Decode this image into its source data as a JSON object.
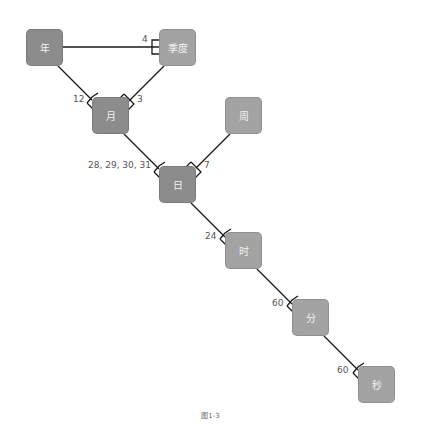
{
  "diagram": {
    "nodes": [
      {
        "id": "year",
        "label": "年",
        "shade": "dark"
      },
      {
        "id": "quarter",
        "label": "季度",
        "shade": "light"
      },
      {
        "id": "month",
        "label": "月",
        "shade": "dark"
      },
      {
        "id": "week",
        "label": "周",
        "shade": "light"
      },
      {
        "id": "day",
        "label": "日",
        "shade": "dark"
      },
      {
        "id": "hour",
        "label": "时",
        "shade": "light"
      },
      {
        "id": "minute",
        "label": "分",
        "shade": "light"
      },
      {
        "id": "second",
        "label": "秒",
        "shade": "light"
      }
    ],
    "edges": [
      {
        "from": "年",
        "to": "季度",
        "multiplicity": "4"
      },
      {
        "from": "年",
        "to": "月",
        "multiplicity": "12"
      },
      {
        "from": "季度",
        "to": "月",
        "multiplicity": "3"
      },
      {
        "from": "月",
        "to": "日",
        "multiplicity": "28, 29, 30, 31"
      },
      {
        "from": "周",
        "to": "日",
        "multiplicity": "7"
      },
      {
        "from": "日",
        "to": "时",
        "multiplicity": "24"
      },
      {
        "from": "时",
        "to": "分",
        "multiplicity": "60"
      },
      {
        "from": "分",
        "to": "秒",
        "multiplicity": "60"
      }
    ],
    "colors": {
      "dark_node": "#8c8c8c",
      "light_node": "#a3a3a3",
      "line": "#1a1a1a"
    }
  },
  "caption": "图1-3"
}
